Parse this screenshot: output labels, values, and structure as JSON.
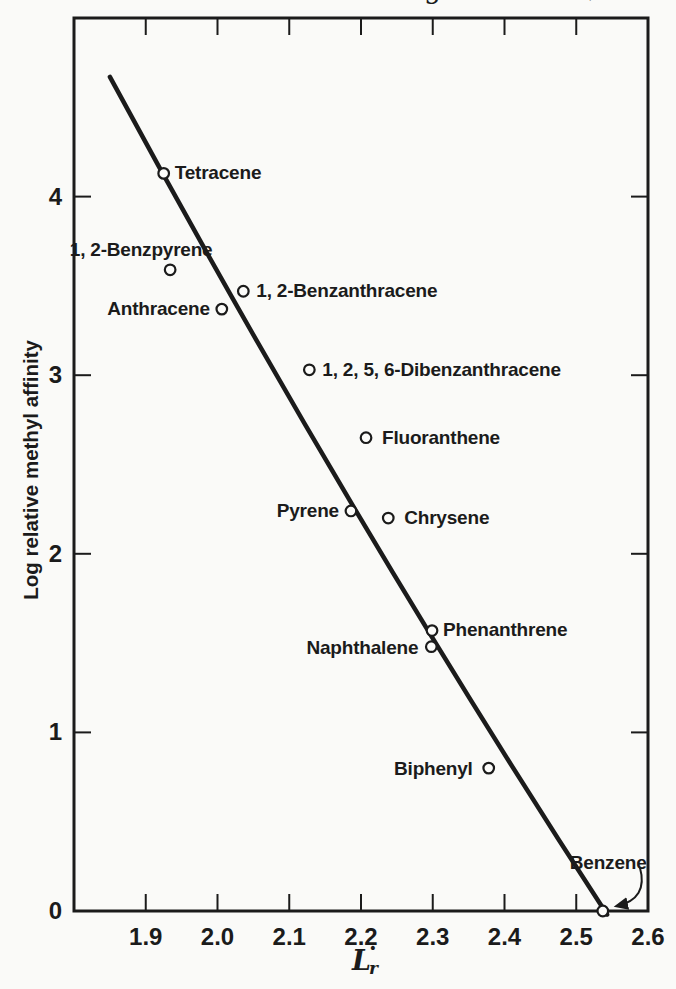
{
  "page": {
    "background": "#fafaf8",
    "ink": "#1b1b1b"
  },
  "scan_artifacts": {
    "top_left_glyph_fragment": "g",
    "top_right_glyph_fragment": ")"
  },
  "chart_data": {
    "type": "scatter",
    "title": "",
    "ylabel": "Log relative methyl affinity",
    "xlabel_base": "L",
    "xlabel_subscript": "r",
    "xlabel_radical_dot": "·",
    "xlim": [
      1.8,
      2.6
    ],
    "ylim": [
      0,
      5.0
    ],
    "grid": false,
    "legend": false,
    "x_ticks": [
      1.9,
      2.0,
      2.1,
      2.2,
      2.3,
      2.4,
      2.5,
      2.6
    ],
    "x_tick_labels": [
      "1.9",
      "2.0",
      "2.1",
      "2.2",
      "2.3",
      "2.4",
      "2.5",
      "2.6"
    ],
    "y_ticks": [
      0,
      1,
      2,
      3,
      4
    ],
    "y_tick_labels": [
      "0",
      "1",
      "2",
      "3",
      "4"
    ],
    "points": [
      {
        "label": "Tetracene",
        "x": 1.925,
        "y": 4.13,
        "anchor": "start",
        "dx": 11,
        "dy": 6
      },
      {
        "label": "1, 2-Benzpyrene",
        "x": 1.934,
        "y": 3.59,
        "anchor": "middle",
        "dx": -29,
        "dy": -14
      },
      {
        "label": "1, 2-Benzanthracene",
        "x": 2.036,
        "y": 3.47,
        "anchor": "start",
        "dx": 13,
        "dy": 6
      },
      {
        "label": "Anthracene",
        "x": 2.006,
        "y": 3.37,
        "anchor": "end",
        "dx": -12,
        "dy": 6
      },
      {
        "label": "1, 2, 5, 6-Dibenzanthracene",
        "x": 2.128,
        "y": 3.03,
        "anchor": "start",
        "dx": 13,
        "dy": 6
      },
      {
        "label": "Fluoranthene",
        "x": 2.207,
        "y": 2.65,
        "anchor": "start",
        "dx": 16,
        "dy": 6
      },
      {
        "label": "Pyrene",
        "x": 2.186,
        "y": 2.24,
        "anchor": "end",
        "dx": -12,
        "dy": 6
      },
      {
        "label": "Chrysene",
        "x": 2.238,
        "y": 2.2,
        "anchor": "start",
        "dx": 16,
        "dy": 6
      },
      {
        "label": "Phenanthrene",
        "x": 2.299,
        "y": 1.57,
        "anchor": "start",
        "dx": 11,
        "dy": 5
      },
      {
        "label": "Naphthalene",
        "x": 2.298,
        "y": 1.48,
        "anchor": "end",
        "dx": -13,
        "dy": 7
      },
      {
        "label": "Biphenyl",
        "x": 2.378,
        "y": 0.8,
        "anchor": "end",
        "dx": -16,
        "dy": 7
      },
      {
        "label": "Benzene",
        "x": 2.537,
        "y": 0.0,
        "anchor": "arrow",
        "dx": -33,
        "dy": -42
      }
    ],
    "fit_line_points": [
      [
        1.85,
        4.67
      ],
      [
        2.19,
        2.26
      ],
      [
        2.543,
        -0.02
      ]
    ]
  }
}
